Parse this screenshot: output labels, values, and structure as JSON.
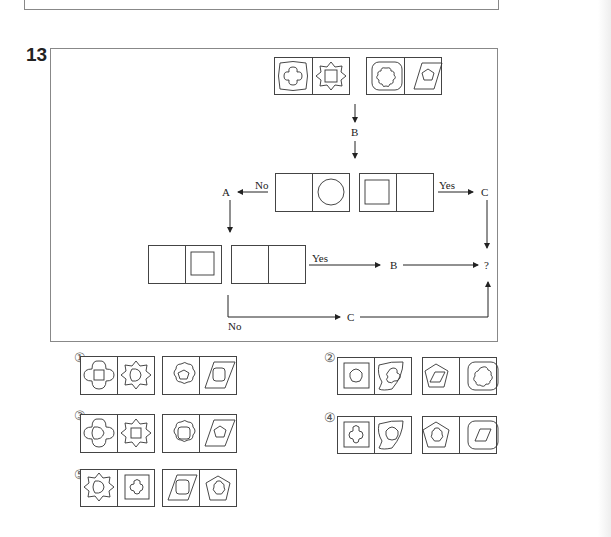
{
  "question": {
    "number": "13",
    "flowchart": {
      "input_tiles": [
        {
          "left": "star-oval with clover",
          "right": "8-point star with square"
        },
        {
          "left": "rounded square with flower",
          "right": "parallelogram with pentagon"
        }
      ],
      "operation_top": "B",
      "decision1": {
        "tiles": [
          {
            "left": "empty",
            "right": "circle"
          },
          {
            "left": "square",
            "right": "empty"
          }
        ],
        "no_label": "No",
        "no_target": "A",
        "yes_label": "Yes",
        "yes_target": "C"
      },
      "decision2": {
        "tiles": [
          {
            "left": "empty",
            "right": "square"
          },
          {
            "left": "empty",
            "right": "empty"
          }
        ],
        "yes_label": "Yes",
        "yes_target": "B",
        "no_label": "No",
        "no_target": "C"
      },
      "result": "?"
    },
    "choices": [
      {
        "label": "①"
      },
      {
        "label": "②"
      },
      {
        "label": "③"
      },
      {
        "label": "④"
      },
      {
        "label": "⑤"
      }
    ]
  }
}
